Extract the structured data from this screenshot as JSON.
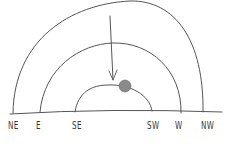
{
  "diagram": {
    "type": "sun-path",
    "style": "hand-drawn pencil sketch",
    "colors": {
      "stroke": "#555555",
      "sun": "#8a8a8a",
      "background": "#ffffff"
    },
    "horizon_labels": [
      {
        "id": "ne",
        "text": "NE"
      },
      {
        "id": "e",
        "text": "E"
      },
      {
        "id": "se",
        "text": "SE"
      },
      {
        "id": "sw",
        "text": "SW"
      },
      {
        "id": "w",
        "text": "W"
      },
      {
        "id": "nw",
        "text": "NW"
      }
    ],
    "arcs": [
      {
        "name": "summer-path",
        "from": "NE",
        "to": "NW"
      },
      {
        "name": "equinox-path",
        "from": "E",
        "to": "W"
      },
      {
        "name": "winter-path",
        "from": "SE",
        "to": "SW"
      }
    ],
    "arrow": {
      "direction": "down",
      "points_to": "winter-path"
    },
    "sun": {
      "on": "winter-path"
    }
  }
}
